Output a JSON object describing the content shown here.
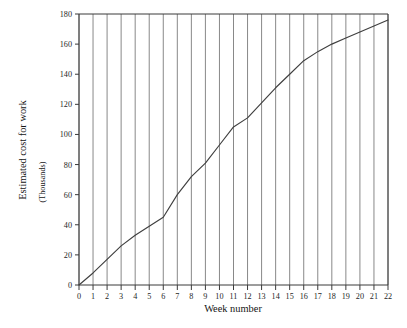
{
  "chart_data": {
    "type": "line",
    "title": "",
    "xlabel": "Week number",
    "ylabel": "Estimated cost for work",
    "ylabel_sub": "(Thousands)",
    "x": [
      0,
      1,
      2,
      3,
      4,
      5,
      6,
      7,
      8,
      9,
      10,
      11,
      12,
      13,
      14,
      15,
      16,
      17,
      18,
      19,
      20,
      21,
      22
    ],
    "values": [
      0,
      8,
      17,
      26,
      33,
      39,
      45,
      60,
      72,
      81,
      93,
      105,
      111,
      121,
      131,
      140,
      149,
      155,
      160,
      164,
      168,
      172,
      176
    ],
    "series": [
      {
        "name": "Estimated cumulative cost",
        "values": [
          0,
          8,
          17,
          26,
          33,
          39,
          45,
          60,
          72,
          81,
          93,
          105,
          111,
          121,
          131,
          140,
          149,
          155,
          160,
          164,
          168,
          172,
          176
        ]
      }
    ],
    "xticks": [
      "0",
      "1",
      "2",
      "3",
      "4",
      "5",
      "6",
      "7",
      "8",
      "9",
      "10",
      "11",
      "12",
      "13",
      "14",
      "15",
      "16",
      "17",
      "18",
      "19",
      "20",
      "21",
      "22"
    ],
    "yticks": [
      "0",
      "20",
      "40",
      "60",
      "80",
      "100",
      "120",
      "140",
      "160",
      "180"
    ],
    "ytick_values": [
      0,
      20,
      40,
      60,
      80,
      100,
      120,
      140,
      160,
      180
    ],
    "xlim": [
      0,
      22
    ],
    "ylim": [
      0,
      180
    ],
    "grid": "vertical-only",
    "legend": "none",
    "line_color": "#3f3f3f",
    "grid_color": "#6b6b6b",
    "axis_color": "#3a3a3a",
    "background_color": "#ffffff"
  }
}
